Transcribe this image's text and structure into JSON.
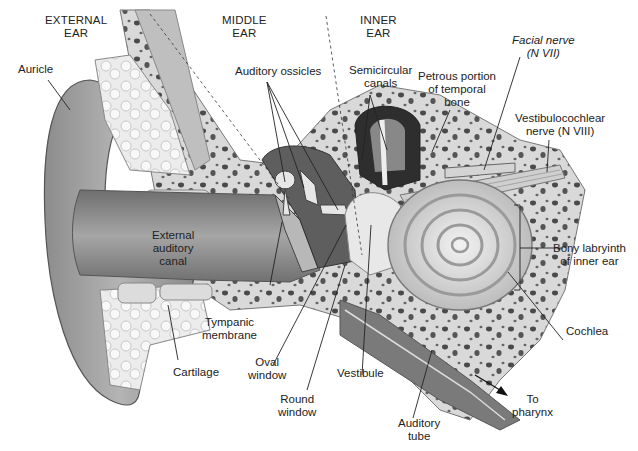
{
  "regions": [
    {
      "id": "external-ear",
      "lines": [
        "EXTERNAL",
        "EAR"
      ]
    },
    {
      "id": "middle-ear",
      "lines": [
        "MIDDLE",
        "EAR"
      ]
    },
    {
      "id": "inner-ear",
      "lines": [
        "INNER",
        "EAR"
      ]
    }
  ],
  "labels": {
    "auricle": [
      "Auricle"
    ],
    "auditory_ossicles": [
      "Auditory ossicles"
    ],
    "semicircular_canals": [
      "Semicircular",
      "canals"
    ],
    "petrous_portion": [
      "Petrous portion",
      "of temporal",
      "bone"
    ],
    "facial_nerve": [
      "Facial nerve",
      "(N VII)"
    ],
    "vestibulocochlear_nerve": [
      "Vestibulocochlear",
      "nerve (N VIII)"
    ],
    "external_auditory_canal": [
      "External",
      "auditory",
      "canal"
    ],
    "bony_labyrinth": [
      "Bony labryinth",
      "of inner ear"
    ],
    "tympanic_membrane": [
      "Tympanic",
      "membrane"
    ],
    "cartilage": [
      "Cartilage"
    ],
    "oval_window": [
      "Oval",
      "window"
    ],
    "round_window": [
      "Round",
      "window"
    ],
    "vestibule": [
      "Vestibule"
    ],
    "cochlea": [
      "Cochlea"
    ],
    "auditory_tube": [
      "Auditory",
      "tube"
    ],
    "to_pharynx": [
      "To",
      "pharynx"
    ]
  },
  "colors": {
    "skin": "#9a9a9a",
    "skin_light": "#c8c8c8",
    "bone": "#d6d6d6",
    "cartilage": "#eeeeee",
    "dark": "#3a3a3a",
    "text": "#222222"
  }
}
